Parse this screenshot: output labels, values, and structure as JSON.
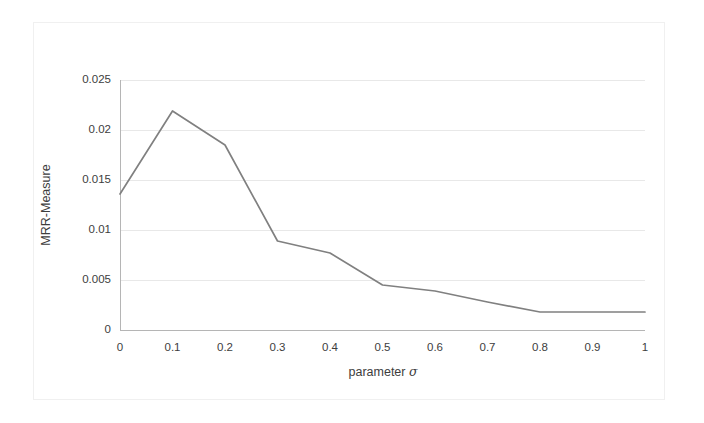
{
  "chart_data": {
    "type": "line",
    "title": "",
    "xlabel": "parameter σ",
    "xlabel_text": "parameter ",
    "xlabel_symbol": "σ",
    "ylabel": "MRR-Measure",
    "xlim": [
      0,
      1
    ],
    "ylim": [
      0,
      0.025
    ],
    "grid": true,
    "grid_axis": "y",
    "legend": false,
    "legend_position": "none",
    "line_color": "#808080",
    "grid_color": "#e8e8e8",
    "axis_color": "#b0b0b0",
    "x": [
      0,
      0.1,
      0.2,
      0.3,
      0.4,
      0.5,
      0.6,
      0.7,
      0.8,
      0.9,
      1
    ],
    "values": [
      0.0136,
      0.0219,
      0.0185,
      0.0089,
      0.0077,
      0.0045,
      0.0039,
      0.0028,
      0.0018,
      0.0018,
      0.0018
    ],
    "series": [
      {
        "name": "MRR-Measure",
        "values": [
          0.0136,
          0.0219,
          0.0185,
          0.0089,
          0.0077,
          0.0045,
          0.0039,
          0.0028,
          0.0018,
          0.0018,
          0.0018
        ]
      }
    ],
    "x_tick_labels": [
      "0",
      "0.1",
      "0.2",
      "0.3",
      "0.4",
      "0.5",
      "0.6",
      "0.7",
      "0.8",
      "0.9",
      "1"
    ],
    "y_tick_labels": [
      "0",
      "0.005",
      "0.01",
      "0.015",
      "0.02",
      "0.025"
    ],
    "y_tick_values": [
      0,
      0.005,
      0.01,
      0.015,
      0.02,
      0.025
    ]
  }
}
